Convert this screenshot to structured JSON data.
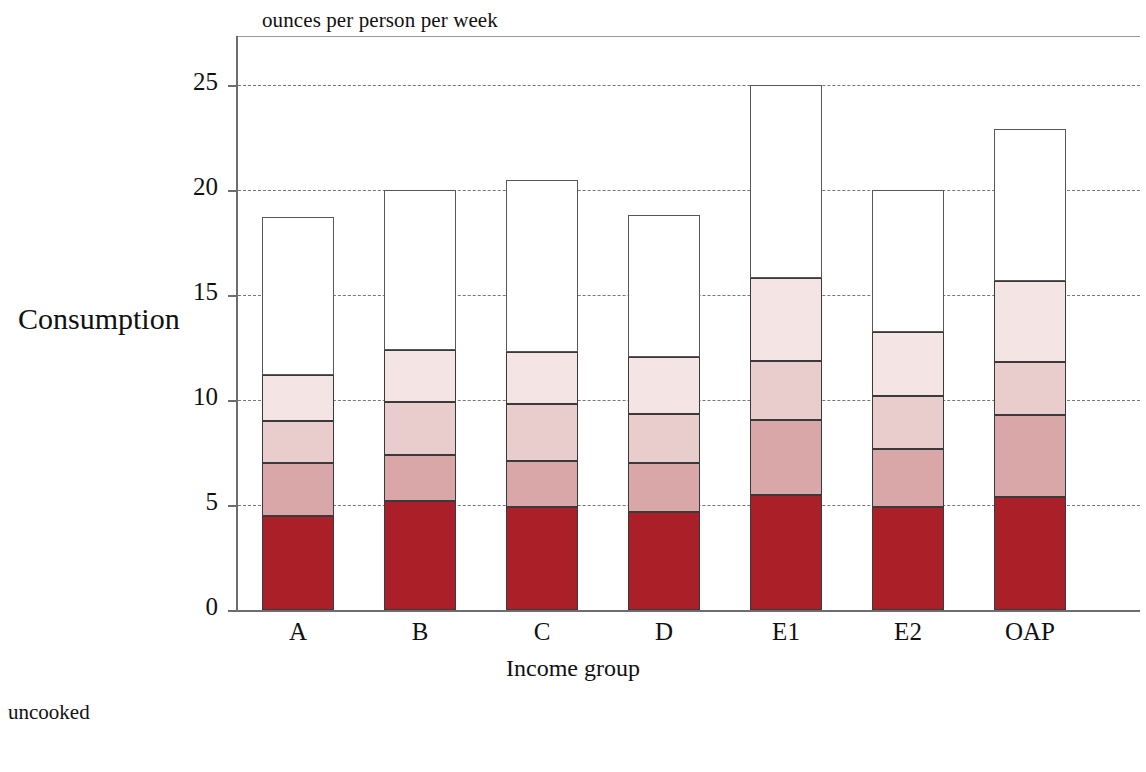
{
  "chart_data": {
    "type": "bar",
    "subtype": "stacked",
    "title": "",
    "top_axis_note": "ounces per person per week",
    "ylabel": "Consumption",
    "xlabel": "Income group",
    "ylim": [
      0,
      26.5
    ],
    "yticks": [
      0,
      5,
      10,
      15,
      20,
      25
    ],
    "ytick_labels": [
      "0",
      "5",
      "10",
      "15",
      "20",
      "25"
    ],
    "grid": "horizontal-dotted",
    "legend_position": "below-plot",
    "categories": [
      "A",
      "B",
      "C",
      "D",
      "E1",
      "E2",
      "OAP"
    ],
    "series": [
      {
        "name": "segment-1",
        "color": "#ab1f28",
        "values": [
          4.5,
          5.2,
          4.9,
          4.65,
          5.5,
          4.9,
          5.4
        ]
      },
      {
        "name": "segment-2",
        "color": "#d9a7a7",
        "values": [
          2.5,
          2.2,
          2.2,
          2.35,
          3.55,
          2.75,
          3.9
        ]
      },
      {
        "name": "segment-3",
        "color": "#e9cccc",
        "values": [
          2.0,
          2.5,
          2.7,
          2.35,
          2.8,
          2.55,
          2.5
        ]
      },
      {
        "name": "segment-4",
        "color": "#f5e4e4",
        "values": [
          2.2,
          2.5,
          2.5,
          2.7,
          3.95,
          3.05,
          3.85
        ]
      },
      {
        "name": "segment-5",
        "color": "#ffffff",
        "values": [
          7.5,
          7.6,
          8.2,
          6.75,
          9.2,
          6.75,
          7.25
        ]
      }
    ],
    "totals": [
      18.7,
      20.0,
      20.5,
      18.8,
      25.0,
      20.0,
      22.9
    ],
    "cumulative_boundaries": {
      "A": [
        4.5,
        7.0,
        9.0,
        11.2,
        18.7
      ],
      "B": [
        5.2,
        7.4,
        9.9,
        12.4,
        20.0
      ],
      "C": [
        4.9,
        7.1,
        9.8,
        12.3,
        20.5
      ],
      "D": [
        4.65,
        7.0,
        9.35,
        12.05,
        18.8
      ],
      "E1": [
        5.5,
        9.05,
        11.85,
        15.8,
        25.0
      ],
      "E2": [
        4.9,
        7.65,
        10.2,
        13.25,
        20.0
      ],
      "OAP": [
        5.4,
        9.3,
        11.8,
        15.65,
        22.9
      ]
    }
  },
  "caption": {
    "line1": "uncooked",
    "line2": ""
  }
}
